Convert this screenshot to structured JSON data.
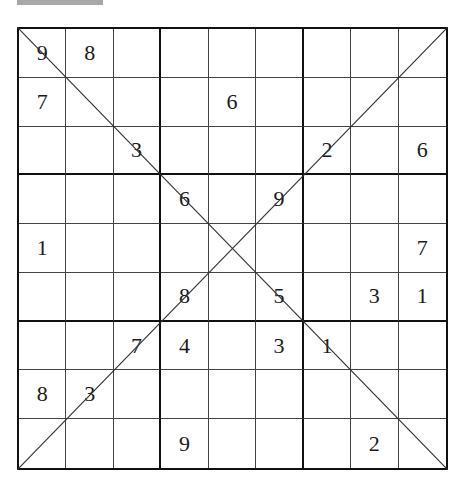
{
  "puzzle": {
    "type": "X-Sudoku (diagonal)",
    "size": 9,
    "colors": {
      "grid_line": "#444444",
      "box_line": "#111111",
      "digit": "#1a1a1a",
      "header_bar": "#a8a8a8"
    },
    "rows": [
      [
        "9",
        "8",
        "",
        "",
        "",
        "",
        "",
        "",
        ""
      ],
      [
        "7",
        "",
        "",
        "",
        "6",
        "",
        "",
        "",
        ""
      ],
      [
        "",
        "",
        "3",
        "",
        "",
        "",
        "2",
        "",
        "6"
      ],
      [
        "",
        "",
        "",
        "6",
        "",
        "9",
        "",
        "",
        ""
      ],
      [
        "1",
        "",
        "",
        "",
        "",
        "",
        "",
        "",
        "7"
      ],
      [
        "",
        "",
        "",
        "8",
        "",
        "5",
        "",
        "3",
        "1"
      ],
      [
        "",
        "",
        "7",
        "4",
        "",
        "3",
        "1",
        "",
        ""
      ],
      [
        "8",
        "3",
        "",
        "",
        "",
        "",
        "",
        "",
        ""
      ],
      [
        "",
        "",
        "",
        "9",
        "",
        "",
        "",
        "2",
        ""
      ]
    ]
  }
}
